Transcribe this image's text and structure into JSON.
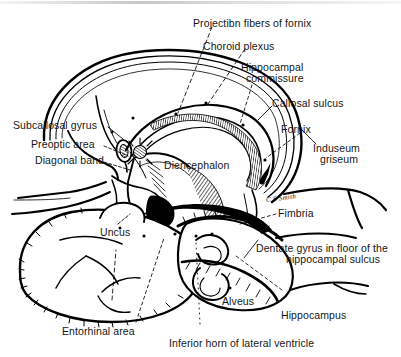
{
  "figure": {
    "kind": "anatomical-illustration",
    "signature": "C S Smith",
    "ink_color": "#000000",
    "background_color": "#ffffff"
  },
  "labels": {
    "projection_fibers": "Projectibn fibers of fornix",
    "choroid_plexus": "Choroid plexus",
    "hippocampal_commissure_l1": "Hippocampal",
    "hippocampal_commissure_l2": "commissure",
    "callosal_sulcus": "Callosal sulcus",
    "fornix": "Fornix",
    "induseum_l1": "Induseum",
    "induseum_l2": "griseum",
    "subcallosal_gyrus": "Subcallosal gyrus",
    "preoptic_area": "Preoptic area",
    "diagonal_band": "Diagonal band",
    "diencephalon": "Diencephalon",
    "fimbria": "Fimbria",
    "dentate_l1": "Dentate gyrus in floor of the",
    "dentate_l2": "hippocampal sulcus",
    "uncus": "Uncus",
    "alveus": "Alveus",
    "hippocampus": "Hippocampus",
    "entorhinal_area": "Entorhinal area",
    "inferior_horn": "Inferior horn of lateral ventricle"
  }
}
